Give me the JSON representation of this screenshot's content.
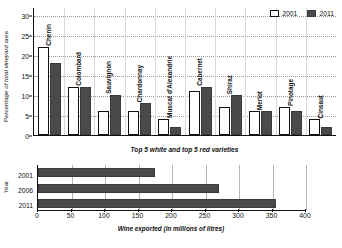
{
  "chart_data": [
    {
      "type": "bar",
      "title": "",
      "xlabel": "Top 5 white and top 5 red varieties",
      "ylabel": "Percentage of total vineyard area",
      "ylim": [
        0,
        32
      ],
      "yticks": [
        0,
        5,
        10,
        15,
        20,
        25,
        30
      ],
      "grid": true,
      "legend_position": "top-right",
      "categories": [
        "Chenin",
        "Colombard",
        "Sauvignon",
        "Chardonnay",
        "Muscat d'Alexandrie",
        "Cabernet",
        "Shiraz",
        "Merlot",
        "Pinotage",
        "Cinsaut"
      ],
      "series": [
        {
          "name": "2001",
          "color": "#ffffff",
          "values": [
            22,
            12,
            6,
            6,
            4,
            11,
            7,
            6,
            7,
            4
          ]
        },
        {
          "name": "2011",
          "color": "#4a4a4a",
          "values": [
            18,
            12,
            10,
            8,
            2,
            12,
            10,
            6,
            6,
            2
          ]
        }
      ]
    },
    {
      "type": "bar",
      "orientation": "horizontal",
      "title": "",
      "xlabel": "Wine exported (in millions of litres)",
      "ylabel": "Year",
      "xlim": [
        0,
        400
      ],
      "xticks": [
        0,
        50,
        100,
        150,
        200,
        250,
        300,
        350,
        400
      ],
      "grid": true,
      "categories": [
        "2001",
        "2006",
        "2011"
      ],
      "values": [
        175,
        270,
        355
      ],
      "color": "#4a4a4a"
    }
  ],
  "top_chart": {
    "ylabel": "Percentage of total vineyard area",
    "xcaption": "Top 5 white and top 5 red varieties",
    "yticks": [
      "30",
      "25",
      "20",
      "15",
      "10",
      "5",
      "0"
    ],
    "legend": [
      {
        "label": "2001"
      },
      {
        "label": "2011"
      }
    ],
    "bars": [
      {
        "name": "Chenin",
        "v2001": 22,
        "v2011": 18
      },
      {
        "name": "Colombard",
        "v2001": 12,
        "v2011": 12
      },
      {
        "name": "Sauvignon",
        "v2001": 6,
        "v2011": 10
      },
      {
        "name": "Chardonnay",
        "v2001": 6,
        "v2011": 8
      },
      {
        "name": "Muscat d'Alexandrie",
        "v2001": 4,
        "v2011": 2
      },
      {
        "name": "Cabernet",
        "v2001": 11,
        "v2011": 12
      },
      {
        "name": "Shiraz",
        "v2001": 7,
        "v2011": 10
      },
      {
        "name": "Merlot",
        "v2001": 6,
        "v2011": 6
      },
      {
        "name": "Pinotage",
        "v2001": 7,
        "v2011": 6
      },
      {
        "name": "Cinsaut",
        "v2001": 4,
        "v2011": 2
      }
    ]
  },
  "bottom_chart": {
    "ylabel": "Year",
    "xcaption": "Wine exported (in millions of litres)",
    "xticks": [
      "0",
      "50",
      "100",
      "150",
      "200",
      "250",
      "300",
      "350",
      "400"
    ],
    "rows": [
      {
        "year": "2001",
        "value": 175
      },
      {
        "year": "2006",
        "value": 270
      },
      {
        "year": "2011",
        "value": 355
      }
    ]
  }
}
